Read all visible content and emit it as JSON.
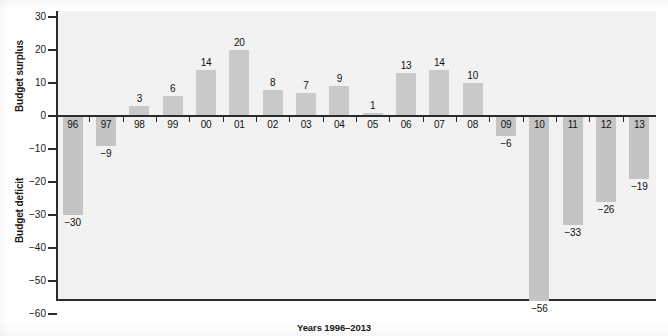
{
  "chart_data": {
    "type": "bar",
    "title": "",
    "xlabel": "Years 1996–2013",
    "ylabel_top": "Budget surplus",
    "ylabel_bottom": "Budget deficit",
    "categories": [
      "96",
      "97",
      "98",
      "99",
      "00",
      "01",
      "02",
      "03",
      "04",
      "05",
      "06",
      "07",
      "08",
      "09",
      "10",
      "11",
      "12",
      "13"
    ],
    "values": [
      -30,
      -9,
      3,
      6,
      14,
      20,
      8,
      7,
      9,
      1,
      13,
      14,
      10,
      -6,
      -56,
      -33,
      -26,
      -19
    ],
    "value_labels": [
      "−30",
      "−9",
      "3",
      "6",
      "14",
      "20",
      "8",
      "7",
      "9",
      "1",
      "13",
      "14",
      "10",
      "−6",
      "−56",
      "−33",
      "−26",
      "−19"
    ],
    "ylim": [
      -60,
      33
    ],
    "yticks": [
      30,
      20,
      10,
      0,
      -10,
      -20,
      -30,
      -40,
      -50,
      -60
    ],
    "ytick_labels": [
      "30",
      "20",
      "10",
      "0",
      "−10",
      "−20",
      "−30",
      "−40",
      "−50",
      "−60"
    ],
    "grid": false,
    "legend": "none",
    "bar_color": "#c9c9c9",
    "axis_color": "#2b2b2b",
    "plot_background": "#f2f2f2",
    "page_background": "#ffffff"
  }
}
